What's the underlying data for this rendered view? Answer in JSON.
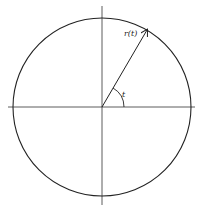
{
  "diagram": {
    "labels": {
      "vector": "r(t)",
      "angle": "t"
    },
    "colors": {
      "stroke": "#222222",
      "background": "#ffffff"
    }
  }
}
